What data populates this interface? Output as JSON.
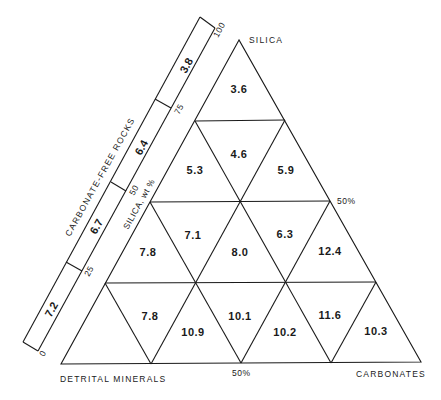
{
  "diagram": {
    "type": "ternary-grid",
    "vertices": {
      "top": "SILICA",
      "bottom_left": "DETRITAL MINERALS",
      "bottom_right": "CARBONATES"
    },
    "edge_labels": {
      "right_mid": "50%",
      "bottom_mid": "50%"
    },
    "axis": {
      "title": "SILICA, wt %",
      "ticks": [
        "0",
        "25",
        "50",
        "75",
        "100"
      ]
    },
    "side_bar": {
      "title": "CARBONATE-FREE ROCKS",
      "segments": [
        "7.2",
        "6.7",
        "6.4",
        "3.8"
      ]
    },
    "cells": [
      {
        "row": 1,
        "value": "3.6"
      },
      {
        "row": 2,
        "value": "5.3"
      },
      {
        "row": 2,
        "value": "4.6"
      },
      {
        "row": 2,
        "value": "5.9"
      },
      {
        "row": 3,
        "value": "7.8"
      },
      {
        "row": 3,
        "value": "7.1"
      },
      {
        "row": 3,
        "value": "8.0"
      },
      {
        "row": 3,
        "value": "6.3"
      },
      {
        "row": 3,
        "value": "12.4"
      },
      {
        "row": 4,
        "value": "7.8"
      },
      {
        "row": 4,
        "value": "10.9"
      },
      {
        "row": 4,
        "value": "10.1"
      },
      {
        "row": 4,
        "value": "10.2"
      },
      {
        "row": 4,
        "value": "11.6"
      },
      {
        "row": 4,
        "value": "10.3"
      }
    ]
  }
}
